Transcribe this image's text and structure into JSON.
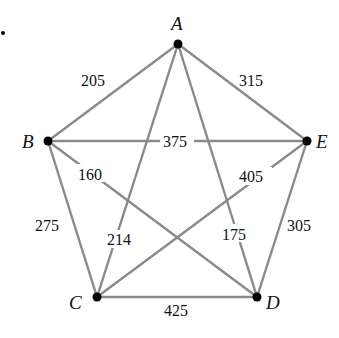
{
  "graph": {
    "vertices": [
      {
        "id": "A",
        "label": "A",
        "x": 178,
        "y": 44
      },
      {
        "id": "B",
        "label": "B",
        "x": 48,
        "y": 141
      },
      {
        "id": "C",
        "label": "C",
        "x": 97,
        "y": 297
      },
      {
        "id": "D",
        "label": "D",
        "x": 257,
        "y": 297
      },
      {
        "id": "E",
        "label": "E",
        "x": 307,
        "y": 141
      }
    ],
    "edges": [
      {
        "from": "A",
        "to": "B",
        "weight": "205"
      },
      {
        "from": "A",
        "to": "E",
        "weight": "315"
      },
      {
        "from": "B",
        "to": "E",
        "weight": "375"
      },
      {
        "from": "B",
        "to": "D",
        "weight": "160"
      },
      {
        "from": "B",
        "to": "C",
        "weight": "275"
      },
      {
        "from": "A",
        "to": "C",
        "weight": "214"
      },
      {
        "from": "A",
        "to": "D",
        "weight": "175"
      },
      {
        "from": "C",
        "to": "E",
        "weight": "405"
      },
      {
        "from": "E",
        "to": "D",
        "weight": "305"
      },
      {
        "from": "C",
        "to": "D",
        "weight": "425"
      }
    ],
    "marker": "•",
    "edge_color": "#8a8a8a",
    "vertex_color": "#000000"
  }
}
